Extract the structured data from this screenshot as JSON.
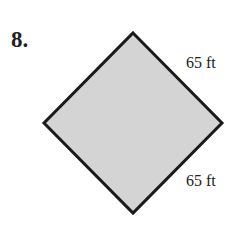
{
  "problem": {
    "number": "8."
  },
  "figure": {
    "shape": "square (rotated 45°, diamond)",
    "fill": "#d4d4d4",
    "stroke": "#1a1a1a",
    "labels": {
      "upper_right_side": "65 ft",
      "lower_right_side": "65 ft"
    }
  }
}
